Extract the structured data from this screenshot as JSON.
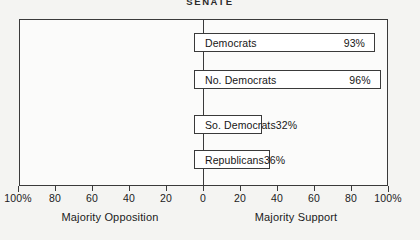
{
  "chart_data": {
    "type": "bar",
    "orientation": "horizontal",
    "title": "SENATE",
    "categories": [
      "Democrats",
      "No. Democrats",
      "So. Democrats",
      "Republicans"
    ],
    "values": [
      93,
      96,
      32,
      36
    ],
    "value_labels": [
      "93%",
      "96%",
      "32%",
      "36%"
    ],
    "bars": [
      {
        "label": "Democrats",
        "value": 93,
        "value_label": "93%",
        "side": "support"
      },
      {
        "label": "No. Democrats",
        "value": 96,
        "value_label": "96%",
        "side": "support"
      },
      {
        "label": "So. Democrats",
        "value": 32,
        "value_label": "32%",
        "side": "support"
      },
      {
        "label": "Republicans",
        "value": 36,
        "value_label": "36%",
        "side": "support"
      }
    ],
    "xlabel": "",
    "ylabel": "",
    "xlim": [
      -100,
      100
    ],
    "grid": false,
    "legend": null,
    "axis": {
      "left_caption": "Majority Opposition",
      "right_caption": "Majority Support",
      "tick_values": [
        -100,
        -80,
        -60,
        -40,
        -20,
        0,
        20,
        40,
        60,
        80,
        100
      ],
      "tick_labels": [
        "100%",
        "80",
        "60",
        "40",
        "20",
        "0",
        "20",
        "40",
        "60",
        "80",
        "100%"
      ]
    },
    "colors": {
      "background": "#f4f4f2",
      "plot_background": "#fbfbfa",
      "line": "#3a3a3a",
      "bar_fill": "#ffffff",
      "text": "#1b1b1b"
    }
  }
}
